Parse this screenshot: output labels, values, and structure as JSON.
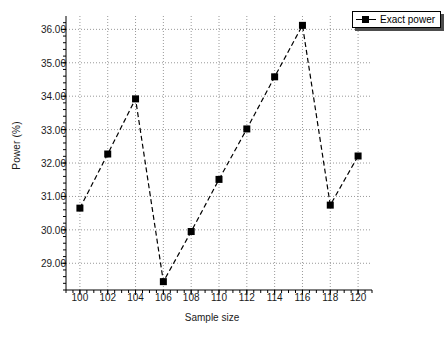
{
  "chart_data": {
    "type": "line",
    "title": "",
    "xlabel": "Sample size",
    "ylabel": "Power (%)",
    "xlim": [
      99,
      121
    ],
    "ylim": [
      28.2,
      36.4
    ],
    "xticks": [
      100,
      102,
      104,
      106,
      108,
      110,
      112,
      114,
      116,
      118,
      120
    ],
    "xtick_labels": [
      "100",
      "102",
      "104",
      "106",
      "108",
      "110",
      "112",
      "114",
      "116",
      "118",
      "120"
    ],
    "yticks": [
      29,
      30,
      31,
      32,
      33,
      34,
      35,
      36
    ],
    "ytick_labels": [
      "29.00",
      "30.00",
      "31.00",
      "32.00",
      "33.00",
      "34.00",
      "35.00",
      "36.00"
    ],
    "grid": true,
    "minor_ticks": true,
    "legend_position": "top-right",
    "series": [
      {
        "name": "Exact power",
        "color": "#000000",
        "marker": "square",
        "linestyle": "dashed",
        "x": [
          100,
          102,
          104,
          106,
          108,
          110,
          112,
          114,
          116,
          118,
          120
        ],
        "values": [
          30.65,
          32.27,
          33.92,
          28.45,
          29.95,
          31.51,
          33.02,
          34.58,
          36.12,
          30.74,
          32.21
        ]
      }
    ]
  },
  "legend": {
    "entries": [
      {
        "label": "Exact power"
      }
    ]
  }
}
